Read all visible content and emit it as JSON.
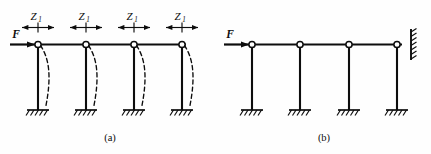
{
  "figure": {
    "background_color": "#fefefe",
    "ink_color": "#0d0d0d",
    "panels": [
      {
        "id": "a",
        "caption": "(a)",
        "force_label": "F",
        "dimension_label_base": "Z",
        "dimension_label_subscript": "1",
        "dimension_labels": [
          "Z",
          "Z",
          "Z",
          "Z"
        ],
        "dimension_subscripts": [
          "1",
          "1",
          "1",
          "1"
        ],
        "joint_count": 4,
        "column_count": 4,
        "support_type": "fixed",
        "has_deflection_curves": true,
        "deflection_curve_count": 4,
        "right_end_support": "free"
      },
      {
        "id": "b",
        "caption": "(b)",
        "force_label": "F",
        "joint_count": 4,
        "column_count": 4,
        "support_type": "fixed",
        "has_deflection_curves": false,
        "deflection_curve_count": 0,
        "right_end_support": "wall-link"
      }
    ]
  },
  "captions": {
    "panel_a": "(a)",
    "panel_b": "(b)"
  },
  "labels": {
    "force_a": "F",
    "force_b": "F",
    "z_text": "Z",
    "z_sub": "1"
  },
  "dimensions": {
    "width": 431,
    "height": 154
  }
}
